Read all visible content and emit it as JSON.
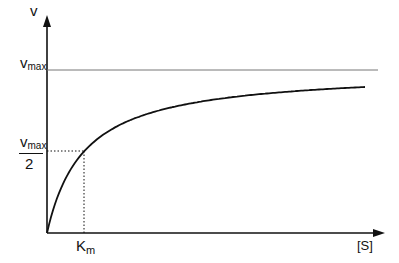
{
  "chart_data": {
    "type": "line",
    "title": "",
    "xlabel": "[S]",
    "ylabel": "v",
    "grid": false,
    "legend": null,
    "series": [
      {
        "name": "Michaelis-Menten curve",
        "equation": "v = Vmax*[S]/(Km+[S])",
        "x_in_Km_units": [
          0,
          0.25,
          0.5,
          1,
          2,
          3,
          4,
          5,
          6,
          7,
          8
        ],
        "y_in_Vmax_units": [
          0,
          0.2,
          0.333,
          0.5,
          0.667,
          0.75,
          0.8,
          0.833,
          0.857,
          0.875,
          0.889
        ]
      }
    ],
    "reference_lines": [
      {
        "type": "horizontal",
        "label": "Vmax",
        "value_in_Vmax_units": 1,
        "style": "solid"
      },
      {
        "type": "horizontal",
        "label": "Vmax/2",
        "value_in_Vmax_units": 0.5,
        "style": "dotted",
        "extends_to": "Km"
      },
      {
        "type": "vertical",
        "label": "Km",
        "value_in_Km_units": 1,
        "style": "dotted",
        "extends_to": "Vmax/2"
      }
    ],
    "y_tick_labels": [
      "Vmax",
      "Vmax/2"
    ],
    "x_tick_labels": [
      "Km"
    ]
  },
  "labels": {
    "y_axis": "v",
    "vmax_main": "v",
    "vmax_sub": "max",
    "half_num_main": "v",
    "half_num_sub": "max",
    "half_den": "2",
    "km_main": "K",
    "km_sub": "m",
    "x_axis": "[S]"
  },
  "colors": {
    "axis": "#111111",
    "curve": "#111111",
    "asymptote": "#777777",
    "guide": "#111111"
  }
}
